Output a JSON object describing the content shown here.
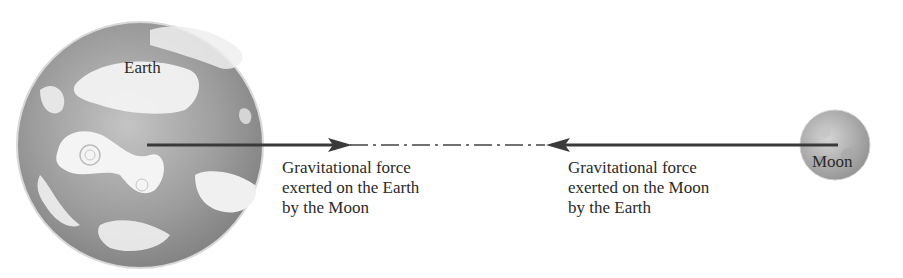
{
  "diagram": {
    "bodies": {
      "earth": {
        "label": "Earth"
      },
      "moon": {
        "label": "Moon"
      }
    },
    "forces": [
      {
        "lines": [
          "Gravitational force",
          "exerted on the Earth",
          "by the Moon"
        ],
        "direction": "toward-moon"
      },
      {
        "lines": [
          "Gravitational force",
          "exerted on the Moon",
          "by the Earth"
        ],
        "direction": "toward-earth"
      }
    ],
    "colors": {
      "arrow": "#3a3a3a",
      "earth_base": "#9a9a9a",
      "clouds": "#f2f2f2",
      "moon_base": "#b5b5b5"
    }
  }
}
